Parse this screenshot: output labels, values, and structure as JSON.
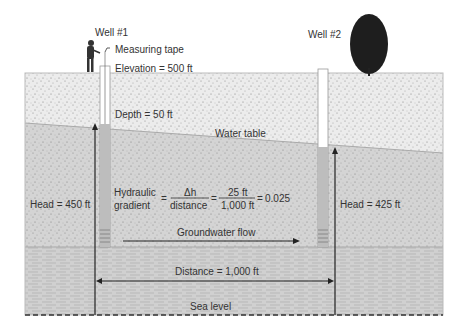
{
  "wells": [
    {
      "label": "Well #1",
      "head_label": "Head = 450 ft"
    },
    {
      "label": "Well #2",
      "head_label": "Head = 425 ft"
    }
  ],
  "labels": {
    "measuring_tape": "Measuring tape",
    "elevation": "Elevation = 500 ft",
    "depth": "Depth = 50 ft",
    "water_table": "Water table",
    "groundwater_flow": "Groundwater flow",
    "distance": "Distance = 1,000 ft",
    "sea_level": "Sea level"
  },
  "formula": {
    "term_top": "Hydraulic",
    "term_bottom": "gradient",
    "eq1": "=",
    "num1": "Δh",
    "den1": "distance",
    "eq2": "=",
    "num2": "25 ft",
    "den2": "1,000 ft",
    "eq3": "=",
    "result": "0.025"
  },
  "colors": {
    "unsaturated": "#ececec",
    "saturated": "#d6d6d6",
    "bedrock": "#cfcfcf",
    "well_casing": "#ffffff",
    "well_water": "#bdbdbd",
    "line": "#222222"
  }
}
